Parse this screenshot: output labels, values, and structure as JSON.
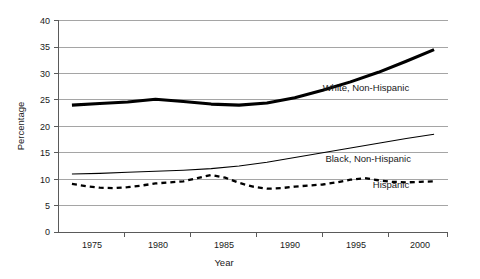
{
  "chart_data": {
    "type": "line",
    "title": "",
    "xlabel": "Year",
    "ylabel": "Percentage",
    "xlim": [
      1973,
      2001
    ],
    "ylim": [
      0,
      40
    ],
    "yticks": [
      0,
      5,
      10,
      15,
      20,
      25,
      30,
      35,
      40
    ],
    "xticks": [
      1975,
      1980,
      1985,
      1990,
      1995,
      2000
    ],
    "grid": "horizontal",
    "legend_position": "inline-right",
    "series": [
      {
        "name": "White, Non-Hispanic",
        "style": "thick-solid",
        "label_x": 1992.0,
        "label_y": 26.6,
        "x": [
          1974,
          1976,
          1978,
          1980,
          1982,
          1984,
          1986,
          1988,
          1990,
          1992,
          1994,
          1996,
          1998,
          2000
        ],
        "values": [
          24.0,
          24.3,
          24.6,
          25.1,
          24.7,
          24.2,
          24.0,
          24.4,
          25.4,
          26.8,
          28.4,
          30.2,
          32.3,
          34.5
        ]
      },
      {
        "name": "Black, Non-Hispanic",
        "style": "thin-solid",
        "label_x": 1992.2,
        "label_y": 13.3,
        "x": [
          1974,
          1976,
          1978,
          1980,
          1982,
          1984,
          1986,
          1988,
          1990,
          1992,
          1994,
          1996,
          1998,
          2000
        ],
        "values": [
          11.0,
          11.1,
          11.3,
          11.5,
          11.7,
          12.0,
          12.5,
          13.2,
          14.1,
          15.0,
          15.9,
          16.8,
          17.7,
          18.5
        ]
      },
      {
        "name": "Hispanic",
        "style": "dashed",
        "label_x": 1995.6,
        "label_y": 8.3,
        "x": [
          1974,
          1975,
          1976,
          1977,
          1978,
          1979,
          1980,
          1981,
          1982,
          1983,
          1984,
          1985,
          1986,
          1987,
          1988,
          1989,
          1990,
          1991,
          1992,
          1993,
          1994,
          1995,
          1996,
          1997,
          1998,
          1999,
          2000
        ],
        "values": [
          9.1,
          8.7,
          8.4,
          8.3,
          8.5,
          8.8,
          9.2,
          9.4,
          9.6,
          10.2,
          10.8,
          10.3,
          9.3,
          8.6,
          8.2,
          8.3,
          8.6,
          8.8,
          9.0,
          9.4,
          9.9,
          10.2,
          9.8,
          9.5,
          9.4,
          9.5,
          9.6
        ]
      }
    ]
  },
  "axes": {
    "y_title": "Percentage",
    "x_title": "Year",
    "y_tick_labels": [
      "0",
      "5",
      "10",
      "15",
      "20",
      "25",
      "30",
      "35",
      "40"
    ],
    "x_tick_labels": [
      "1975",
      "1980",
      "1985",
      "1990",
      "1995",
      "2000"
    ]
  },
  "labels": {
    "white_non_hispanic": "White, Non-Hispanic",
    "black_non_hispanic": "Black, Non-Hispanic",
    "hispanic": "Hispanic"
  },
  "colors": {
    "line": "#000000",
    "gridline": "#8e8e8e",
    "axis": "#5a5a5a",
    "text": "#1a1a1a",
    "background": "#ffffff"
  }
}
